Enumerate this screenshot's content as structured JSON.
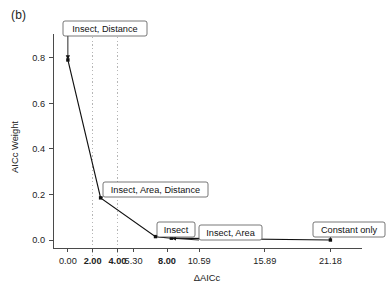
{
  "figure": {
    "panel_label": "(b)",
    "background_color": "#ffffff",
    "line_color": "#111111",
    "gridline_color": "#b6b6b6",
    "axis_color": "#4a4a4a"
  },
  "chart_data": {
    "type": "line",
    "title": "",
    "subtitle": "",
    "xlabel": "ΔAICc",
    "ylabel": "AICc Weight",
    "xlim": [
      -1.2,
      22.6
    ],
    "ylim": [
      -0.035,
      0.86
    ],
    "grid": "vertical dotted gridlines at x = 2.00 and x = 4.00",
    "legend": "none; points annotated with boxed labels",
    "x_ticks": [
      {
        "value": 0.0,
        "label": "0.00",
        "bold": false
      },
      {
        "value": 2.0,
        "label": "2.00",
        "bold": true
      },
      {
        "value": 4.0,
        "label": "4.00",
        "bold": true
      },
      {
        "value": 5.3,
        "label": "5.30",
        "bold": false
      },
      {
        "value": 8.0,
        "label": "8.00",
        "bold": true
      },
      {
        "value": 10.59,
        "label": "10.59",
        "bold": false
      },
      {
        "value": 15.89,
        "label": "15.89",
        "bold": false
      },
      {
        "value": 21.18,
        "label": "21.18",
        "bold": false
      }
    ],
    "y_ticks": [
      {
        "value": 0.0,
        "label": "0.0"
      },
      {
        "value": 0.2,
        "label": "0.2"
      },
      {
        "value": 0.4,
        "label": "0.4"
      },
      {
        "value": 0.6,
        "label": "0.6"
      },
      {
        "value": 0.8,
        "label": "0.8"
      }
    ],
    "gridlines_x": [
      2.0,
      4.0
    ],
    "series": [
      {
        "name": "AICc weight by model",
        "x": [
          0.0,
          2.64,
          7.07,
          8.35,
          21.18
        ],
        "y": [
          0.79,
          0.185,
          0.015,
          0.008,
          0.0
        ]
      }
    ],
    "points": [
      {
        "model": "Insect, Distance",
        "delta_aicc": 0.0,
        "weight": 0.79
      },
      {
        "model": "Insect, Area, Distance",
        "delta_aicc": 2.64,
        "weight": 0.185
      },
      {
        "model": "Insect",
        "delta_aicc": 7.07,
        "weight": 0.015
      },
      {
        "model": "Insect, Area",
        "delta_aicc": 8.35,
        "weight": 0.008
      },
      {
        "model": "Constant only",
        "delta_aicc": 21.18,
        "weight": 0.0
      }
    ],
    "annotations": [
      {
        "text": "Insect, Distance",
        "box_x": 63,
        "box_y": 21,
        "box_w": 84,
        "box_h": 15
      },
      {
        "text": "Insect, Area, Distance",
        "box_x": 103,
        "box_y": 182,
        "box_w": 105,
        "box_h": 15
      },
      {
        "text": "Insect",
        "box_x": 157,
        "box_y": 222,
        "box_w": 38,
        "box_h": 15
      },
      {
        "text": "Insect, Area",
        "box_x": 199,
        "box_y": 225,
        "box_w": 63,
        "box_h": 15
      },
      {
        "text": "Constant only",
        "box_x": 313,
        "box_y": 222,
        "box_w": 72,
        "box_h": 15
      }
    ]
  }
}
